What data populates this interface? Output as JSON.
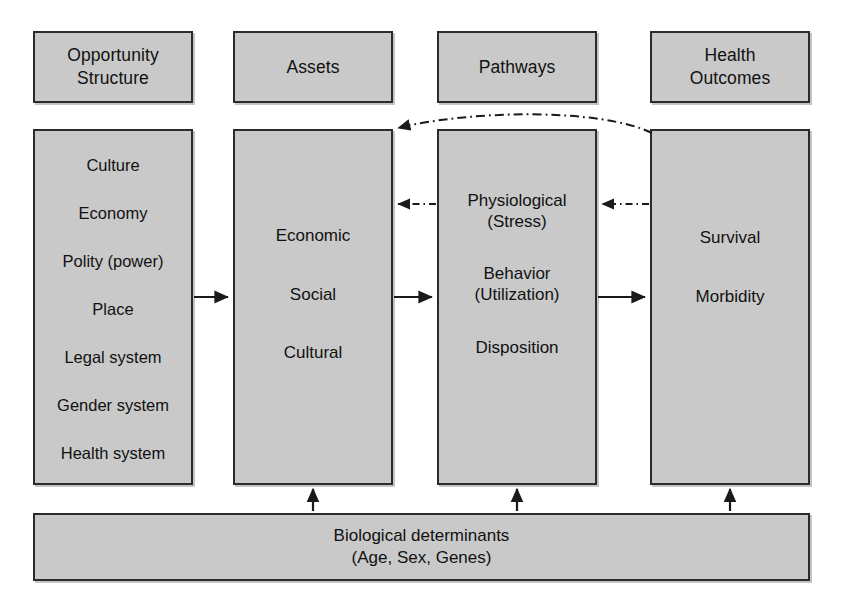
{
  "diagram": {
    "colors": {
      "box_fill": "#c9c9c9",
      "box_border": "#2b2b2b",
      "text": "#111111",
      "background": "#ffffff",
      "arrow": "#1a1a1a"
    }
  },
  "headers": {
    "opportunity": "Opportunity\nStructure",
    "assets": "Assets",
    "pathways": "Pathways",
    "outcomes": "Health\nOutcomes"
  },
  "columns": {
    "opportunity": {
      "items": [
        "Culture",
        "Economy",
        "Polity (power)",
        "Place",
        "Legal system",
        "Gender system",
        "Health system"
      ]
    },
    "assets": {
      "items": [
        "Economic",
        "Social",
        "Cultural"
      ]
    },
    "pathways": {
      "items": [
        "Physiological\n(Stress)",
        "Behavior\n(Utilization)",
        "Disposition"
      ]
    },
    "outcomes": {
      "items": [
        "Survival",
        "Morbidity"
      ]
    }
  },
  "bottom_band": {
    "label": "Biological determinants\n(Age, Sex, Genes)"
  },
  "arrows": {
    "forward": [
      {
        "name": "opportunity-to-assets",
        "style": "solid",
        "direction": "right"
      },
      {
        "name": "assets-to-pathways",
        "style": "solid",
        "direction": "right"
      },
      {
        "name": "pathways-to-outcomes",
        "style": "solid",
        "direction": "right"
      }
    ],
    "feedback": [
      {
        "name": "pathways-to-assets-feedback",
        "style": "dash-dot",
        "direction": "left"
      },
      {
        "name": "outcomes-to-pathways-feedback",
        "style": "dash-dot",
        "direction": "left"
      },
      {
        "name": "outcomes-to-assets-long-feedback",
        "style": "dash-dot-curved",
        "direction": "left"
      }
    ],
    "biological": [
      {
        "name": "biological-to-assets",
        "style": "solid",
        "direction": "up"
      },
      {
        "name": "biological-to-pathways",
        "style": "solid",
        "direction": "up"
      },
      {
        "name": "biological-to-outcomes",
        "style": "solid",
        "direction": "up"
      }
    ]
  }
}
